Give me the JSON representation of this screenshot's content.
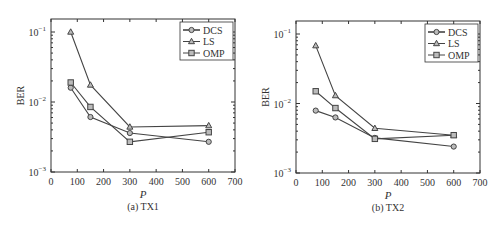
{
  "chart_data": [
    {
      "type": "line",
      "title": "(a) TX1",
      "xlabel": "P",
      "ylabel": "BER",
      "yscale": "log",
      "xlim": [
        0,
        700
      ],
      "ylim": [
        0.001,
        0.15
      ],
      "xticks": [
        0,
        100,
        200,
        300,
        400,
        500,
        600,
        700
      ],
      "yticks": [
        "10^-3",
        "10^-2",
        "10^-1"
      ],
      "legend_position": "upper right",
      "x": [
        75,
        150,
        300,
        600
      ],
      "series": [
        {
          "name": "DCS",
          "marker": "circle",
          "values": [
            0.016,
            0.0061,
            0.0036,
            0.0027
          ]
        },
        {
          "name": "LS",
          "marker": "triangle",
          "values": [
            0.1,
            0.0175,
            0.0044,
            0.0046
          ]
        },
        {
          "name": "OMP",
          "marker": "square",
          "values": [
            0.019,
            0.0085,
            0.0027,
            0.0037
          ]
        }
      ]
    },
    {
      "type": "line",
      "title": "(b) TX2",
      "xlabel": "P",
      "ylabel": "BER",
      "yscale": "log",
      "xlim": [
        0,
        700
      ],
      "ylim": [
        0.001,
        0.15
      ],
      "xticks": [
        0,
        100,
        200,
        300,
        400,
        500,
        600,
        700
      ],
      "yticks": [
        "10^-3",
        "10^-2",
        "10^-1"
      ],
      "legend_position": "upper right",
      "x": [
        75,
        150,
        300,
        600
      ],
      "series": [
        {
          "name": "DCS",
          "marker": "circle",
          "values": [
            0.0079,
            0.0063,
            0.0032,
            0.0024
          ]
        },
        {
          "name": "LS",
          "marker": "triangle",
          "values": [
            0.068,
            0.013,
            0.0044,
            0.0035
          ]
        },
        {
          "name": "OMP",
          "marker": "square",
          "values": [
            0.015,
            0.0086,
            0.0031,
            0.0035
          ]
        }
      ]
    }
  ],
  "colors": {
    "axis": "#333333",
    "line": "#444444",
    "marker_fill": "#bbbbbb"
  }
}
